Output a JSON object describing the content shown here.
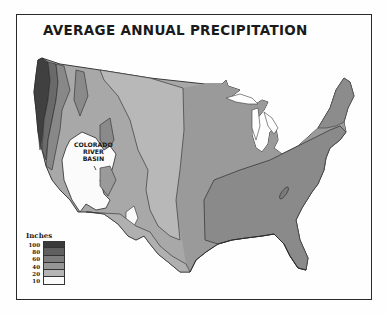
{
  "title": "AVERAGE ANNUAL PRECIPITATION",
  "annotation": {
    "lines": [
      "COLORADO",
      "RIVER",
      "BASIN"
    ]
  },
  "legend": {
    "title": "Inches",
    "items": [
      {
        "label": "100",
        "color": "#3a3a3a"
      },
      {
        "label": "80",
        "color": "#5f5f5f"
      },
      {
        "label": "60",
        "color": "#7d7d7d"
      },
      {
        "label": "40",
        "color": "#969696"
      },
      {
        "label": "20",
        "color": "#b4b4b4"
      },
      {
        "label": "10",
        "color": "#fafafa"
      }
    ]
  },
  "colors": {
    "background": "#fefefe",
    "border": "#2a2a2a",
    "outline": "#3a3a3a"
  }
}
